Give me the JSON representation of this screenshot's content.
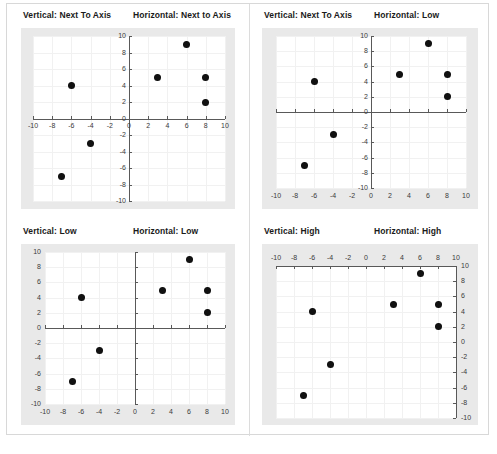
{
  "figure": {
    "caption": ""
  },
  "charts": [
    {
      "id": "top-left",
      "vertical_title": "Vertical: Next To Axis",
      "horizontal_title": "Horizontal: Next to Axis",
      "x_label_position": "next-to-axis",
      "y_label_position": "next-to-axis"
    },
    {
      "id": "top-right",
      "vertical_title": "Vertical: Next To Axis",
      "horizontal_title": "Horizontal: Low",
      "x_label_position": "low",
      "y_label_position": "next-to-axis"
    },
    {
      "id": "bottom-left",
      "vertical_title": "Vertical: Low",
      "horizontal_title": "Horizontal: Low",
      "x_label_position": "low",
      "y_label_position": "low"
    },
    {
      "id": "bottom-right",
      "vertical_title": "Vertical: High",
      "horizontal_title": "Horizontal: High",
      "x_label_position": "high",
      "y_label_position": "high"
    }
  ],
  "chart_data": {
    "type": "scatter",
    "title": "",
    "xlabel": "",
    "ylabel": "",
    "xlim": [
      -10,
      10
    ],
    "ylim": [
      -10,
      10
    ],
    "xticks": [
      -10,
      -8,
      -6,
      -4,
      -2,
      0,
      2,
      4,
      6,
      8,
      10
    ],
    "yticks": [
      -10,
      -8,
      -6,
      -4,
      -2,
      0,
      2,
      4,
      6,
      8,
      10
    ],
    "xtick_labels": [
      "-10",
      "-8",
      "-6",
      "-4",
      "-2",
      "0",
      "2",
      "4",
      "6",
      "8",
      "10"
    ],
    "ytick_labels": [
      "-10",
      "-8",
      "-6",
      "-4",
      "-2",
      "0",
      "2",
      "4",
      "6",
      "8",
      "10"
    ],
    "grid": true,
    "legend": false,
    "marker": "diamond",
    "marker_color": "#111111",
    "series": [
      {
        "name": "points",
        "points": [
          {
            "x": -7,
            "y": -7
          },
          {
            "x": -6,
            "y": 4
          },
          {
            "x": -4,
            "y": -3
          },
          {
            "x": 3,
            "y": 5
          },
          {
            "x": 6,
            "y": 9
          },
          {
            "x": 8,
            "y": 5
          },
          {
            "x": 8,
            "y": 2
          }
        ]
      }
    ],
    "note": "All four panels plot the same seven points; only the axis tick-label placement differs."
  },
  "colors": {
    "axis": "#595959",
    "grid": "#f1f1f1",
    "plot_background": "#ffffff",
    "chart_background": "#e9e9e9",
    "marker": "#111111",
    "title_text": "#1a1a1a",
    "tick_text": "#3a3a3a"
  }
}
